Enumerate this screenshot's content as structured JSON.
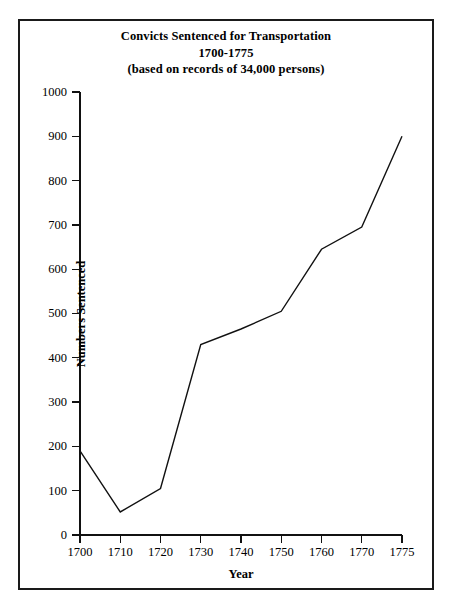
{
  "figure": {
    "title_line1": "Convicts Sentenced for Transportation",
    "title_line2": "1700-1775",
    "title_line3": "(based on records of 34,000 persons)",
    "border_color": "#1a1a1a",
    "line_color": "#111111",
    "background": "#ffffff"
  },
  "chart_data": {
    "type": "line",
    "title": "Convicts Sentenced for Transportation 1700-1775 (based on records of 34,000 persons)",
    "xlabel": "Year",
    "ylabel": "Numbers Sentenced",
    "categories": [
      "1700",
      "1710",
      "1720",
      "1730",
      "1740",
      "1750",
      "1760",
      "1770",
      "1775"
    ],
    "values": [
      190,
      52,
      105,
      430,
      465,
      505,
      645,
      695,
      900
    ],
    "ylim": [
      0,
      1000
    ],
    "yticks": [
      0,
      100,
      200,
      300,
      400,
      500,
      600,
      700,
      800,
      900,
      1000
    ],
    "ytick_labels": [
      "0",
      "100",
      "200",
      "300",
      "400",
      "500",
      "600",
      "700",
      "800",
      "900",
      "1000"
    ],
    "xtick_labels": [
      "1700",
      "1710",
      "1720",
      "1730",
      "1740",
      "1750",
      "1760",
      "1770",
      "1775"
    ],
    "grid": false,
    "legend": "none",
    "series": [
      {
        "name": "Convicts sentenced",
        "values": [
          190,
          52,
          105,
          430,
          465,
          505,
          645,
          695,
          900
        ]
      }
    ]
  }
}
